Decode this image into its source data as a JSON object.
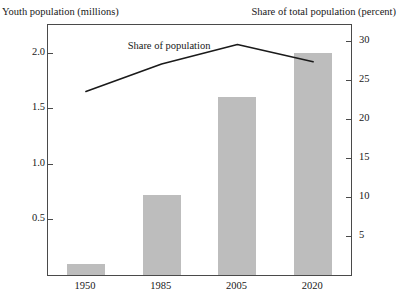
{
  "chart_data": {
    "type": "bar",
    "title": "",
    "categories": [
      "1950",
      "1985",
      "2005",
      "2020"
    ],
    "series": [
      {
        "name": "Youth population",
        "type": "bar",
        "axis": "left",
        "values": [
          0.1,
          0.72,
          1.6,
          2.0
        ],
        "color": "#bdbdbd"
      },
      {
        "name": "Share of population",
        "type": "line",
        "axis": "right",
        "values": [
          23.5,
          27.0,
          29.5,
          27.3
        ],
        "color": "#1a1a1a"
      }
    ],
    "annotations": [
      {
        "text": "Share of population",
        "series": "Share of population"
      }
    ],
    "left_axis": {
      "label": "Youth population (millions)",
      "ticks": [
        "0.5",
        "1.0",
        "1.5",
        "2.0"
      ],
      "tick_values": [
        0.5,
        1.0,
        1.5,
        2.0
      ],
      "ylim": [
        0,
        2.25
      ]
    },
    "right_axis": {
      "label": "Share of total population (percent)",
      "ticks": [
        "5",
        "10",
        "15",
        "20",
        "25",
        "30"
      ],
      "tick_values": [
        5,
        10,
        15,
        20,
        25,
        30
      ],
      "ylim": [
        0,
        32
      ]
    },
    "xlabel": "",
    "grid": false,
    "legend": "none"
  },
  "labels": {
    "left_axis_caption": "Youth population (millions)",
    "right_axis_caption": "Share of total population (percent)",
    "line_annotation": "Share of population"
  }
}
